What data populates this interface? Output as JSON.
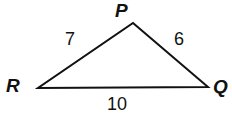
{
  "figure": {
    "type": "triangle-diagram",
    "background_color": "#ffffff",
    "stroke_color": "#111111",
    "stroke_width": 2,
    "width": 232,
    "height": 129,
    "vertices": [
      {
        "id": "P",
        "label": "P",
        "x": 133,
        "y": 23
      },
      {
        "id": "R",
        "label": "R",
        "x": 38,
        "y": 88
      },
      {
        "id": "Q",
        "label": "Q",
        "x": 208,
        "y": 87
      }
    ],
    "sides": [
      {
        "id": "PR",
        "label": "7",
        "from": "R",
        "to": "P"
      },
      {
        "id": "PQ",
        "label": "6",
        "from": "P",
        "to": "Q"
      },
      {
        "id": "RQ",
        "label": "10",
        "from": "R",
        "to": "Q"
      }
    ]
  }
}
